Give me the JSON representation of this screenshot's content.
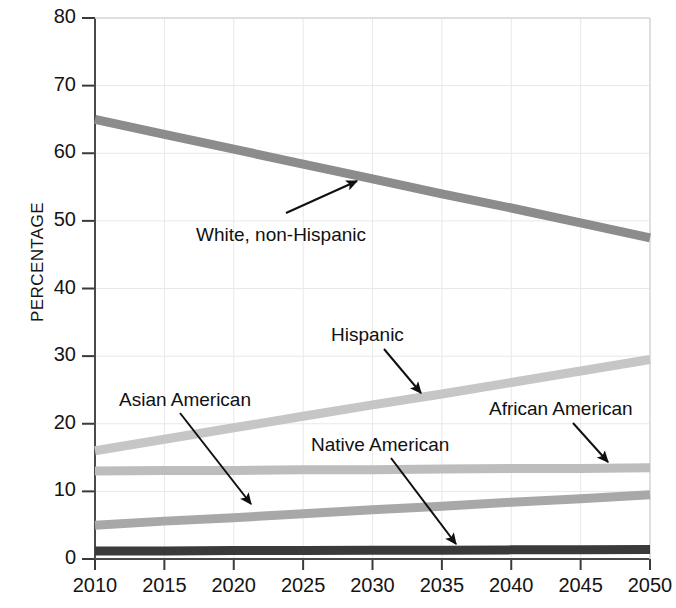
{
  "chart_data": {
    "type": "line",
    "title": "",
    "xlabel": "",
    "ylabel": "PERCENTAGE",
    "x": [
      2010,
      2015,
      2020,
      2025,
      2030,
      2035,
      2040,
      2045,
      2050
    ],
    "xlim": [
      2010,
      2050
    ],
    "ylim": [
      0,
      80
    ],
    "y_ticks": [
      0,
      10,
      20,
      30,
      40,
      50,
      60,
      70,
      80
    ],
    "x_ticks": [
      2010,
      2015,
      2020,
      2025,
      2030,
      2035,
      2040,
      2045,
      2050
    ],
    "grid": true,
    "legend": "inline-annotations",
    "series": [
      {
        "name": "White, non-Hispanic",
        "color": "#8c8c8c",
        "values": [
          65.0,
          62.8,
          60.6,
          58.4,
          56.2,
          54.0,
          51.9,
          49.7,
          47.5
        ]
      },
      {
        "name": "Hispanic",
        "color": "#c6c6c6",
        "values": [
          16.0,
          17.7,
          19.4,
          21.1,
          22.8,
          24.4,
          26.1,
          27.8,
          29.5
        ]
      },
      {
        "name": "African American",
        "color": "#bdbdbd",
        "values": [
          13.0,
          13.1,
          13.1,
          13.2,
          13.2,
          13.3,
          13.4,
          13.4,
          13.5
        ]
      },
      {
        "name": "Asian American",
        "color": "#a8a8a8",
        "values": [
          5.0,
          5.6,
          6.1,
          6.7,
          7.3,
          7.8,
          8.4,
          8.9,
          9.5
        ]
      },
      {
        "name": "Native American",
        "color": "#3a3a3a",
        "values": [
          1.2,
          1.2,
          1.25,
          1.25,
          1.3,
          1.3,
          1.35,
          1.35,
          1.4
        ]
      }
    ],
    "annotations": [
      {
        "text": "White, non-Hispanic",
        "label_x": 196,
        "label_y": 241,
        "arrow_from_x": 286,
        "arrow_from_y": 213,
        "arrow_to_x": 357,
        "arrow_to_y": 181
      },
      {
        "text": "Hispanic",
        "label_x": 331,
        "label_y": 341,
        "arrow_from_x": 384,
        "arrow_from_y": 349,
        "arrow_to_x": 421,
        "arrow_to_y": 393
      },
      {
        "text": "Asian American",
        "label_x": 119,
        "label_y": 406,
        "arrow_from_x": 180,
        "arrow_from_y": 413,
        "arrow_to_x": 251,
        "arrow_to_y": 504
      },
      {
        "text": "Native American",
        "label_x": 311,
        "label_y": 451,
        "arrow_from_x": 391,
        "arrow_from_y": 458,
        "arrow_to_x": 456,
        "arrow_to_y": 544
      },
      {
        "text": "African American",
        "label_x": 489,
        "label_y": 415,
        "arrow_from_x": 573,
        "arrow_from_y": 423,
        "arrow_to_x": 608,
        "arrow_to_y": 462
      }
    ]
  },
  "axis": {
    "y_title": "PERCENTAGE",
    "y_tick_labels": [
      "80",
      "70",
      "60",
      "50",
      "40",
      "30",
      "20",
      "10",
      "0"
    ],
    "x_tick_labels": [
      "2010",
      "2015",
      "2020",
      "2025",
      "2030",
      "2035",
      "2040",
      "2045",
      "2050"
    ]
  }
}
